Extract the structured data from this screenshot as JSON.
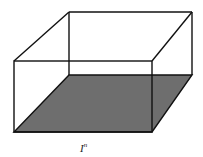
{
  "diagram": {
    "label": {
      "base": "I",
      "exponent": "n"
    },
    "colors": {
      "edge": "#111111",
      "base_fill": "#6e6e6e",
      "background": "#ffffff"
    },
    "vertices": {
      "front_top_left": [
        14,
        61
      ],
      "front_top_right": [
        152,
        61
      ],
      "front_bottom_left": [
        14,
        132
      ],
      "front_bottom_right": [
        152,
        132
      ],
      "back_top_left": [
        69,
        12
      ],
      "back_top_right": [
        192,
        12
      ],
      "back_bottom_left": [
        69,
        75
      ],
      "back_bottom_right": [
        192,
        75
      ]
    }
  }
}
